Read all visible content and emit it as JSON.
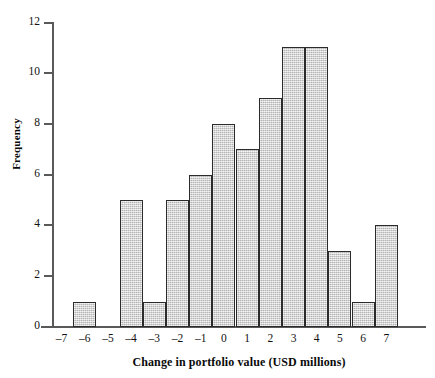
{
  "chart_data": {
    "type": "bar",
    "title": "",
    "subtitle": "",
    "xlabel": "Change in portfolio value (USD millions)",
    "ylabel": "Frequency",
    "categories": [
      "-7",
      "-6",
      "-5",
      "-4",
      "-3",
      "-2",
      "-1",
      "0",
      "1",
      "2",
      "3",
      "4",
      "5",
      "6",
      "7"
    ],
    "values": [
      0,
      1,
      0,
      5,
      1,
      5,
      6,
      8,
      7,
      9,
      11,
      11,
      3,
      1,
      4
    ],
    "xlim": [
      -7.5,
      7.5
    ],
    "ylim": [
      0,
      12
    ],
    "x_tick_labels": [
      "–7",
      "–6",
      "–5",
      "–4",
      "–3",
      "–2",
      "–1",
      "0",
      "1",
      "2",
      "3",
      "4",
      "5",
      "6",
      "7"
    ],
    "y_tick_labels": [
      "0",
      "2",
      "4",
      "6",
      "8",
      "10",
      "12"
    ],
    "y_tick_values": [
      0,
      2,
      4,
      6,
      8,
      10,
      12
    ],
    "grid": false,
    "legend": null,
    "legend_position": "none",
    "bar_fill_color": "#cfcfcf",
    "bar_edge_color": "#2b2b2b",
    "axis_color": "#595959",
    "background_color": "#ffffff",
    "bin_width": 1,
    "bins_centered_on_ticks": true,
    "annotations": []
  },
  "axes": {
    "y_title": "Frequency",
    "x_title": "Change in portfolio value (USD millions)"
  }
}
